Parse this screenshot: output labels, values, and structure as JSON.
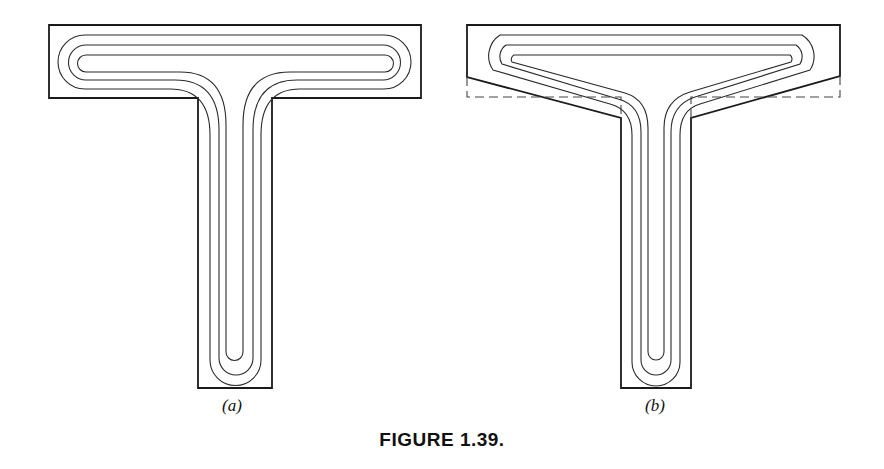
{
  "figure": {
    "caption": "FIGURE 1.39.",
    "panels": [
      {
        "id": "a",
        "label": "(a)",
        "shape": "T-section with rectangular flange, three nested reinforcement bar loops"
      },
      {
        "id": "b",
        "label": "(b)",
        "shape": "T-section with chamfered (haunched) flange underside, dashed outline showing original rectangular flange, three nested reinforcement bar loops"
      }
    ]
  },
  "colors": {
    "line": "#1a1a1a",
    "background": "#ffffff"
  }
}
